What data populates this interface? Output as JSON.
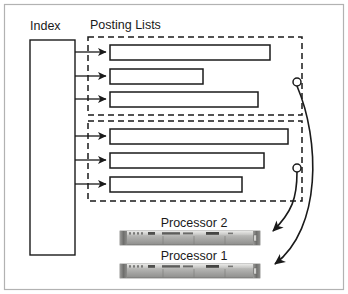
{
  "figure": {
    "background_color": "#ffffff",
    "border_color": "#b0b0b0",
    "stroke_color": "#1a1a1a"
  },
  "labels": {
    "index": "Index",
    "posting_lists": "Posting Lists",
    "processor_2": "Processor 2",
    "processor_1": "Processor 1"
  },
  "index_block": {
    "name": "Index",
    "x": 30,
    "y": 40,
    "width": 45,
    "height": 215
  },
  "groups": [
    {
      "name": "posting-list-group-top",
      "x": 88,
      "y": 37,
      "width": 214,
      "height": 78,
      "terminal_circle": {
        "cx": 297,
        "cy": 82,
        "r": 4
      },
      "bars": [
        {
          "name": "posting-list-bar-1",
          "x": 110,
          "y": 45,
          "width": 160,
          "height": 15
        },
        {
          "name": "posting-list-bar-2",
          "x": 110,
          "y": 69,
          "width": 93,
          "height": 15
        },
        {
          "name": "posting-list-bar-3",
          "x": 110,
          "y": 92,
          "width": 148,
          "height": 15
        }
      ]
    },
    {
      "name": "posting-list-group-bottom",
      "x": 88,
      "y": 121,
      "width": 214,
      "height": 80,
      "terminal_circle": {
        "cx": 297,
        "cy": 168,
        "r": 4
      },
      "bars": [
        {
          "name": "posting-list-bar-4",
          "x": 110,
          "y": 129,
          "width": 178,
          "height": 15
        },
        {
          "name": "posting-list-bar-5",
          "x": 110,
          "y": 153,
          "width": 154,
          "height": 15
        },
        {
          "name": "posting-list-bar-6",
          "x": 110,
          "y": 177,
          "width": 132,
          "height": 15
        }
      ]
    }
  ],
  "index_arrows": [
    {
      "name": "index-arrow-1",
      "from_x": 75,
      "y": 52,
      "to_x": 107
    },
    {
      "name": "index-arrow-2",
      "from_x": 75,
      "y": 76,
      "to_x": 107
    },
    {
      "name": "index-arrow-3",
      "from_x": 75,
      "y": 99,
      "to_x": 107
    },
    {
      "name": "index-arrow-4",
      "from_x": 75,
      "y": 136,
      "to_x": 107
    },
    {
      "name": "index-arrow-5",
      "from_x": 75,
      "y": 160,
      "to_x": 107
    },
    {
      "name": "index-arrow-6",
      "from_x": 75,
      "y": 184,
      "to_x": 107
    }
  ],
  "processors": [
    {
      "name": "processor-2",
      "label": "Processor 2",
      "label_x": 194,
      "label_y": 227,
      "server_x": 120,
      "server_y": 231,
      "server_width": 140,
      "server_height": 14
    },
    {
      "name": "processor-1",
      "label": "Processor 1",
      "label_x": 194,
      "label_y": 260,
      "server_x": 120,
      "server_y": 264,
      "server_width": 140,
      "server_height": 14
    }
  ],
  "dispatch_arrows": [
    {
      "name": "dispatch-arrow-group-bottom-to-processor-2",
      "path": "M 297 172 C 297 200 290 212 272 231"
    },
    {
      "name": "dispatch-arrow-group-top-to-processor-1",
      "path": "M 297 86 C 318 140 320 225 274 264"
    }
  ]
}
